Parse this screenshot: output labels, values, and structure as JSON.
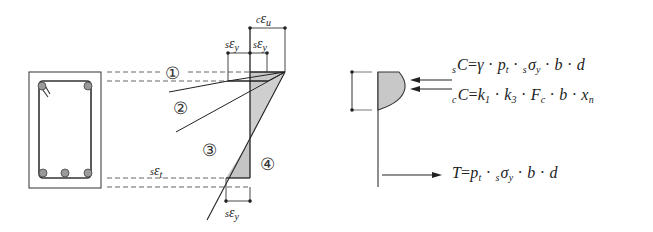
{
  "figure": {
    "cross_section": {
      "bars_top": 2,
      "bars_bottom": 3,
      "colors": {
        "bar_fill": "#9a9a9a",
        "stroke": "#333333"
      }
    },
    "strain_diagram": {
      "labels": {
        "c_eps_u": {
          "pre": "c",
          "sym": "ε",
          "sub": "u"
        },
        "s_eps_y_top_left": {
          "pre": "s",
          "sym": "ε",
          "sub": "y"
        },
        "s_eps_y_top_right": {
          "pre": "s",
          "sym": "ε",
          "sub": "y"
        },
        "s_eps_t": {
          "pre": "s",
          "sym": "ε",
          "sub": "t"
        },
        "s_eps_y_bottom": {
          "pre": "s",
          "sym": "ε",
          "sub": "y"
        }
      },
      "cases": [
        "①",
        "②",
        "③",
        "④"
      ],
      "colors": {
        "shade": "#c8c8c8",
        "line": "#222222",
        "dash": "#555555"
      }
    },
    "stress_diagram": {
      "colors": {
        "shade": "#c8c8c8"
      }
    },
    "equations": {
      "sC": {
        "lhs_pre": "s",
        "lhs": "C",
        "rhs": [
          "γ",
          "p",
          "t",
          "s",
          "σ",
          "y",
          "b",
          "d"
        ]
      },
      "cC": {
        "lhs_pre": "c",
        "lhs": "C",
        "rhs": [
          "k",
          "1",
          "k",
          "3",
          "F",
          "c",
          "b",
          "x",
          "n"
        ]
      },
      "T": {
        "lhs": "T",
        "rhs": [
          "p",
          "t",
          "s",
          "σ",
          "y",
          "b",
          "d"
        ]
      }
    },
    "text": {
      "eq_sC": {
        "pre": "s",
        "C": "C",
        "eq": "=",
        "gamma": "γ",
        "dot": "·",
        "p": "p",
        "p_sub": "t",
        "sig_pre": "s",
        "sigma": "σ",
        "sig_sub": "y",
        "b": "b",
        "d": "d"
      },
      "eq_cC": {
        "pre": "c",
        "C": "C",
        "eq": "=",
        "k": "k",
        "k1_sub": "1",
        "k3_sub": "3",
        "dot": "·",
        "F": "F",
        "F_sub": "c",
        "b": "b",
        "x": "x",
        "x_sub": "n"
      },
      "eq_T": {
        "T": "T",
        "eq": "=",
        "p": "p",
        "p_sub": "t",
        "dot": "·",
        "sig_pre": "s",
        "sigma": "σ",
        "sig_sub": "y",
        "b": "b",
        "d": "d"
      }
    }
  }
}
